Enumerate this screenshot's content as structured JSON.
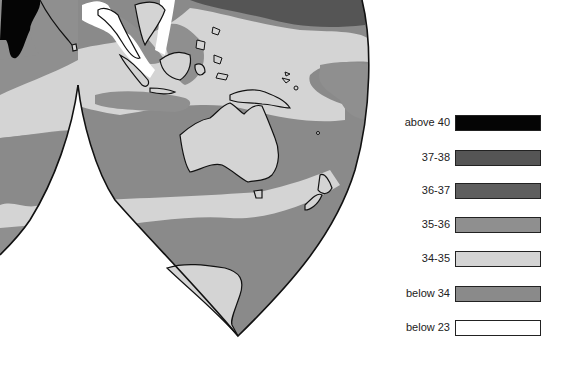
{
  "map": {
    "type": "thematic-choropleth",
    "projection": "interrupted (lobed)",
    "region": "Indian Ocean, Southeast Asia, Australia, New Zealand, Antarctica",
    "colors": {
      "above_40": "#050505",
      "37_38": "#555555",
      "36_37": "#5e5e5e",
      "35_36": "#8f8f8f",
      "34_35": "#d4d4d4",
      "below_34": "#8a8a8a",
      "below_23": "#ffffff",
      "coastline": "#111111"
    }
  },
  "legend": {
    "items": [
      {
        "label": "above 40",
        "color": "#050505"
      },
      {
        "label": "37-38",
        "color": "#555555"
      },
      {
        "label": "36-37",
        "color": "#5e5e5e"
      },
      {
        "label": "35-36",
        "color": "#8f8f8f"
      },
      {
        "label": "34-35",
        "color": "#d4d4d4"
      },
      {
        "label": "below 34",
        "color": "#8a8a8a"
      },
      {
        "label": "below 23",
        "color": "#ffffff"
      }
    ]
  }
}
